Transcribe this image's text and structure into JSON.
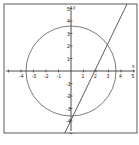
{
  "chart_data": {
    "type": "line",
    "title": "",
    "xlabel": "x",
    "ylabel": "y",
    "xlim": [
      -4.5,
      5
    ],
    "ylim": [
      -5,
      5
    ],
    "x_ticks": [
      "-4",
      "-3",
      "-2",
      "-1",
      "1",
      "2",
      "3",
      "4",
      "5"
    ],
    "y_ticks": [
      "5",
      "4",
      "3",
      "2",
      "1",
      "-1",
      "-2",
      "-3",
      "-4"
    ],
    "series": [
      {
        "name": "circle x^2+y^2=13",
        "shape": "circle",
        "center": [
          0,
          0
        ],
        "radius": 3.6
      },
      {
        "name": "line y=2x-4",
        "shape": "line",
        "points": [
          [
            -0.5,
            -5
          ],
          [
            4.5,
            5
          ]
        ]
      }
    ],
    "intersections": [
      [
        3,
        2
      ],
      [
        -0.2,
        -3.6
      ]
    ],
    "grid": false,
    "legend": "none"
  }
}
